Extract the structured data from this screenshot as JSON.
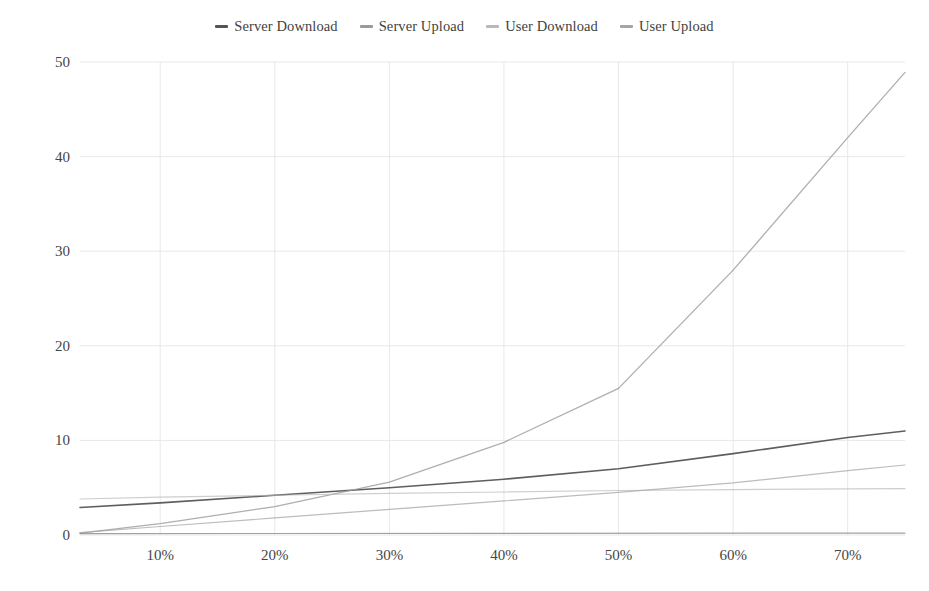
{
  "chart_data": {
    "type": "line",
    "title": "",
    "subtitle": "",
    "xlabel": "",
    "ylabel": "",
    "xlim": [
      3,
      75
    ],
    "ylim": [
      0,
      50
    ],
    "grid": true,
    "legend_position": "top-center",
    "x_tick_labels": [
      "10%",
      "20%",
      "30%",
      "40%",
      "50%",
      "60%",
      "70%"
    ],
    "x_tick_values": [
      10,
      20,
      30,
      40,
      50,
      60,
      70
    ],
    "y_tick_labels": [
      "0",
      "10",
      "20",
      "30",
      "40",
      "50"
    ],
    "y_tick_values": [
      0,
      10,
      20,
      30,
      40,
      50
    ],
    "series": [
      {
        "name": "Server Download",
        "color": "#555555",
        "x": [
          3,
          10,
          20,
          30,
          40,
          50,
          60,
          70,
          75
        ],
        "values": [
          2.9,
          3.4,
          4.2,
          5.0,
          5.9,
          7.0,
          8.6,
          10.3,
          11.0
        ]
      },
      {
        "name": "Server Upload",
        "color": "#9a9a9a",
        "x": [
          3,
          10,
          20,
          30,
          40,
          50,
          60,
          70,
          75
        ],
        "values": [
          0.2,
          1.2,
          3.0,
          5.6,
          9.8,
          15.5,
          28.0,
          42.0,
          48.9
        ]
      },
      {
        "name": "User Download",
        "color": "#b9b9b9",
        "x": [
          3,
          10,
          20,
          30,
          40,
          50,
          60,
          70,
          75
        ],
        "values": [
          3.8,
          4.0,
          4.2,
          4.4,
          4.55,
          4.7,
          4.8,
          4.88,
          4.9
        ]
      },
      {
        "name": "User Upload",
        "color": "#a5a5a5",
        "x": [
          3,
          10,
          20,
          30,
          40,
          50,
          60,
          70,
          75
        ],
        "values": [
          0.25,
          0.9,
          1.8,
          2.7,
          3.6,
          4.5,
          5.5,
          6.8,
          7.4
        ]
      }
    ],
    "baseline_series": {
      "name": "baseline",
      "color": "#8a8a8a",
      "x": [
        3,
        75
      ],
      "values": [
        0.15,
        0.2
      ]
    },
    "colors": {
      "grid": "#e8e8e8",
      "text": "#454545",
      "background": "#ffffff"
    }
  },
  "legend": {
    "items": [
      {
        "label": "Server Download"
      },
      {
        "label": "Server Upload"
      },
      {
        "label": "User Download"
      },
      {
        "label": "User Upload"
      }
    ]
  }
}
